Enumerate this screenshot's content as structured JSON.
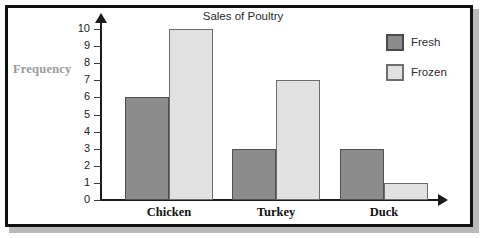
{
  "chart_data": {
    "type": "bar",
    "title": "Sales of Poultry",
    "xlabel": "",
    "ylabel": "Frequency",
    "categories": [
      "Chicken",
      "Turkey",
      "Duck"
    ],
    "series": [
      {
        "name": "Fresh",
        "color": "#8c8c8c",
        "values": [
          6,
          3,
          3
        ]
      },
      {
        "name": "Frozen",
        "color": "#e1e1e1",
        "values": [
          10,
          7,
          1
        ]
      }
    ],
    "ylim": [
      0,
      10
    ],
    "yticks": [
      "10",
      "9",
      "8",
      "7",
      "6",
      "5",
      "4",
      "3",
      "2",
      "1",
      "0"
    ],
    "grid": false,
    "legend_position": "top-right"
  },
  "legend": {
    "items": [
      {
        "label": "Fresh"
      },
      {
        "label": "Frozen"
      }
    ]
  },
  "axes": {
    "y_axis_title": "Frequency",
    "y_axis_title_color": "#9a9a9a"
  }
}
